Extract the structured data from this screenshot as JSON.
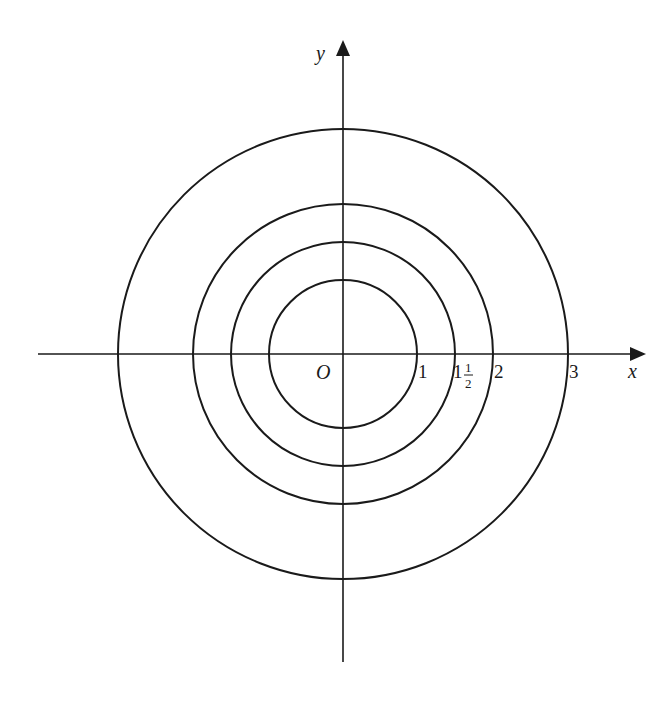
{
  "diagram": {
    "title": "",
    "type": "concentric-circles",
    "center_label": "O",
    "axes": {
      "x_label": "x",
      "y_label": "y"
    },
    "circles": [
      {
        "radius": 1,
        "label": "1"
      },
      {
        "radius": 1.5,
        "label": "1½",
        "label_whole": "1",
        "label_num": "1",
        "label_den": "2"
      },
      {
        "radius": 2,
        "label": "2"
      },
      {
        "radius": 3,
        "label": "3"
      }
    ],
    "stroke_color": "#1a1a1a",
    "background": "#ffffff"
  }
}
